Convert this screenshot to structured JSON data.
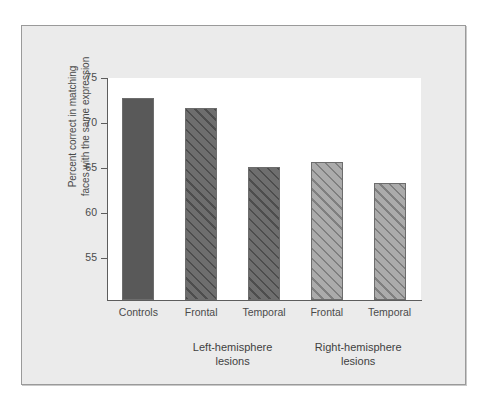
{
  "chart_data": {
    "type": "bar",
    "title": "",
    "subtitle": "",
    "xlabel": "",
    "ylabel": "Percent correct in matching faces with the same expression",
    "ylabel_lines": [
      "Percent correct in matching",
      "faces with the same expression"
    ],
    "ylim": [
      50.3,
      75
    ],
    "yticks": [
      55,
      60,
      65,
      70,
      75
    ],
    "ytick_labels": [
      "55",
      "60",
      "65",
      "70",
      "75"
    ],
    "grid": false,
    "legend": false,
    "categories": [
      "Controls",
      "Frontal",
      "Temporal",
      "Frontal",
      "Temporal"
    ],
    "values": [
      72.8,
      71.7,
      65.1,
      65.7,
      63.3
    ],
    "bar_styles": [
      "solid-dark",
      "hatch-dark",
      "hatch-dark",
      "hatch-light",
      "hatch-light"
    ],
    "groups": [
      {
        "label_lines": [
          "Left-hemisphere",
          "lesions"
        ],
        "members": [
          1,
          2
        ]
      },
      {
        "label_lines": [
          "Right-hemisphere",
          "lesions"
        ],
        "members": [
          3,
          4
        ]
      }
    ],
    "colors": {
      "bar_solid_dark": "#595959",
      "bar_hatch_dark": "#6e6e6e",
      "bar_hatch_light": "#ababab",
      "bar_outline": "#6d6d6d",
      "axis": "#5d5d5d",
      "figure_background": "#ebebeb",
      "plot_background": "#ffffff",
      "text": "#4a4a4a",
      "frame_border": "#9a9a9a"
    }
  },
  "axis": {
    "y_title_line1": "Percent correct in matching",
    "y_title_line2": "faces with the same expression",
    "ytick_0": "55",
    "ytick_1": "60",
    "ytick_2": "65",
    "ytick_3": "70",
    "ytick_4": "75"
  },
  "categories": {
    "c0": "Controls",
    "c1": "Frontal",
    "c2": "Temporal",
    "c3": "Frontal",
    "c4": "Temporal"
  },
  "groups": {
    "left_line1": "Left-hemisphere",
    "left_line2": "lesions",
    "right_line1": "Right-hemisphere",
    "right_line2": "lesions"
  }
}
